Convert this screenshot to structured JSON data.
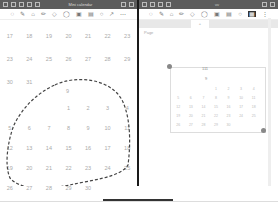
{
  "left_window": {
    "title": "Mini calendar",
    "titlebar_icons": [
      "sidebar-icon",
      "grid-icon",
      "list-icon",
      "layout-icon",
      "share-icon"
    ],
    "toolbar_tools": [
      "lasso-icon",
      "pen-icon",
      "highlighter-icon",
      "pencil-icon",
      "eraser-icon",
      "shapes-icon",
      "image-icon",
      "text-icon",
      "sticker-icon",
      "pointer-icon",
      "more-icon"
    ],
    "prev_month_rows": [
      [
        "17",
        "18",
        "19",
        "20",
        "21",
        "22",
        "23"
      ],
      [
        "23",
        "24",
        "25",
        "26",
        "27",
        "28",
        "29"
      ],
      [
        "30",
        "31",
        "",
        "",
        "",
        "",
        ""
      ]
    ],
    "month_header": "9",
    "month_rows": [
      [
        "",
        "",
        "",
        "1",
        "2",
        "3",
        "4"
      ],
      [
        "5",
        "6",
        "7",
        "8",
        "9",
        "10",
        "11"
      ],
      [
        "12",
        "13",
        "14",
        "15",
        "16",
        "17",
        "18"
      ],
      [
        "19",
        "20",
        "21",
        "22",
        "23",
        "24",
        "25"
      ],
      [
        "26",
        "27",
        "28",
        "29",
        "30",
        "",
        ""
      ]
    ]
  },
  "right_window": {
    "toolbar_tools": [
      "lasso-icon",
      "pen-icon",
      "highlighter-icon",
      "pencil-icon",
      "eraser-icon",
      "shapes-icon",
      "image-icon",
      "text-icon",
      "sticker-icon",
      "selected-tool-icon",
      "more-icon"
    ],
    "tabs": [
      "",
      "",
      "",
      "+",
      "",
      "",
      "",
      ""
    ],
    "breadcrumb": "Page",
    "selection_label": "111",
    "mini_header": "9",
    "mini_rows": [
      [
        "",
        "",
        "",
        "1",
        "2",
        "3",
        "4"
      ],
      [
        "5",
        "6",
        "7",
        "8",
        "9",
        "10",
        "11"
      ],
      [
        "12",
        "13",
        "14",
        "15",
        "16",
        "17",
        "18"
      ],
      [
        "19",
        "20",
        "21",
        "22",
        "23",
        "24",
        "25"
      ],
      [
        "26",
        "27",
        "28",
        "29",
        "30",
        "",
        ""
      ]
    ]
  }
}
